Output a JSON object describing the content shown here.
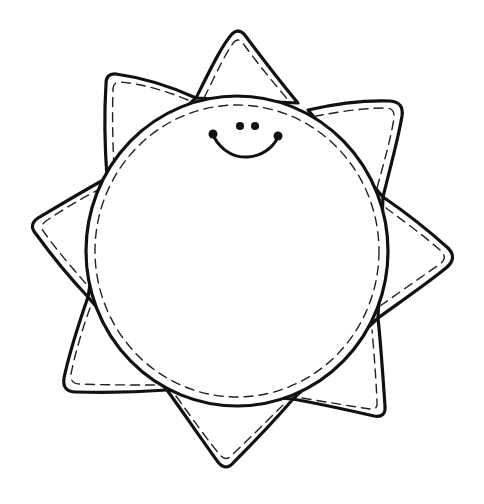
{
  "illustration": {
    "subject": "smiling sun coloring page",
    "style": "black outline with dashed stitch line, white fill",
    "colors": {
      "background": "#ffffff",
      "line": "#111111"
    },
    "sun_body": {
      "center": [
        237,
        251
      ],
      "rx": 151,
      "ry": 155
    },
    "ray_count": 8,
    "rays": [
      {
        "name": "top",
        "tip": [
          238,
          32
        ]
      },
      {
        "name": "upper-left",
        "tip": [
          108,
          75
        ]
      },
      {
        "name": "left",
        "tip": [
          32,
          225
        ]
      },
      {
        "name": "lower-left",
        "tip": [
          63,
          390
        ]
      },
      {
        "name": "bottom",
        "tip": [
          226,
          468
        ]
      },
      {
        "name": "lower-right",
        "tip": [
          383,
          416
        ]
      },
      {
        "name": "right",
        "tip": [
          455,
          256
        ]
      },
      {
        "name": "upper-right",
        "tip": [
          400,
          103
        ]
      }
    ],
    "face": {
      "expression": "smile",
      "eyes": 2,
      "cheek_dots": 2
    }
  }
}
